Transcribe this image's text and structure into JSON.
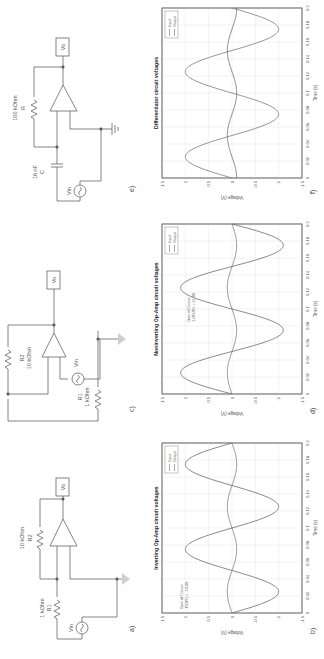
{
  "figure": {
    "panels": [
      {
        "id": "a",
        "label": "a)",
        "type": "circuit",
        "name": "Inverting amplifier",
        "components": {
          "R1": {
            "name": "R1",
            "value": "1 kOhm"
          },
          "R2": {
            "name": "R2",
            "value": "10 kOhm"
          },
          "source": "Vin",
          "probe": "Vo"
        }
      },
      {
        "id": "b",
        "label": "b)",
        "type": "chart",
        "title": "Inverting Op-Amp circuit voltages",
        "annotation_line1": "Gain of Circuit:",
        "annotation_line2": "-R2/R1 = -10.00"
      },
      {
        "id": "c",
        "label": "c)",
        "type": "circuit",
        "name": "Noninverting amplifier",
        "components": {
          "R1": {
            "name": "R1",
            "value": "1 kOhm"
          },
          "R2": {
            "name": "R2",
            "value": "10 kOhm"
          },
          "source": "Vin",
          "probe": "Vo"
        }
      },
      {
        "id": "d",
        "label": "d)",
        "type": "chart",
        "title": "Noninverting Op-Amp circuit voltages",
        "annotation_line1": "Gain of Circuit:",
        "annotation_line2": "1+R2/R1 = 11.00"
      },
      {
        "id": "e",
        "label": "e)",
        "type": "circuit",
        "name": "Differentiator",
        "components": {
          "C": {
            "name": "C",
            "value": "16 nF"
          },
          "R": {
            "name": "R",
            "value": "100 kOhm"
          },
          "source": "Vin",
          "probe": "Vo"
        }
      },
      {
        "id": "f",
        "label": "f)",
        "type": "chart",
        "title": "Differentiator circuit voltages",
        "annotation_line1": "",
        "annotation_line2": ""
      }
    ],
    "axes": {
      "xlabel": "Time (s)",
      "ylabel": "Voltage (V)",
      "xticks": [
        "0",
        "0.02",
        "0.04",
        "0.06",
        "0.08",
        "0.1",
        "0.12",
        "0.14",
        "0.16",
        "0.18",
        "0.2"
      ],
      "yticks": [
        "1.5",
        "1",
        "0.5",
        "0",
        "-0.5",
        "-1",
        "-1.5"
      ]
    },
    "legend": {
      "input": "Input",
      "output": "Output"
    },
    "colors": {
      "input": "#7a7a7a",
      "output": "#6a6a6a",
      "grid": "#e6e6e6",
      "axis": "#555555"
    }
  },
  "chart_data": [
    {
      "type": "line",
      "title": "Inverting Op-Amp circuit voltages",
      "xlabel": "Time (s)",
      "ylabel": "Voltage (V)",
      "xlim": [
        0,
        0.2
      ],
      "ylim": [
        -1.5,
        1.5
      ],
      "grid": true,
      "legend_position": "top-right",
      "x": [
        0,
        0.025,
        0.05,
        0.075,
        0.1,
        0.125,
        0.15,
        0.175,
        0.2
      ],
      "series": [
        {
          "name": "Input",
          "values": [
            0,
            0.1,
            0,
            -0.1,
            0,
            0.1,
            0,
            -0.1,
            0
          ]
        },
        {
          "name": "Output",
          "values": [
            0,
            -1.0,
            0,
            1.0,
            0,
            -1.0,
            0,
            1.0,
            0
          ]
        }
      ],
      "annotations": [
        "Gain of Circuit:",
        "-R2/R1 = -10.00"
      ]
    },
    {
      "type": "line",
      "title": "Noninverting Op-Amp circuit voltages",
      "xlabel": "Time (s)",
      "ylabel": "Voltage (V)",
      "xlim": [
        0,
        0.2
      ],
      "ylim": [
        -1.5,
        1.5
      ],
      "grid": true,
      "legend_position": "top-right",
      "x": [
        0,
        0.025,
        0.05,
        0.075,
        0.1,
        0.125,
        0.15,
        0.175,
        0.2
      ],
      "series": [
        {
          "name": "Input",
          "values": [
            0,
            0.1,
            0,
            -0.1,
            0,
            0.1,
            0,
            -0.1,
            0
          ]
        },
        {
          "name": "Output",
          "values": [
            0,
            1.1,
            0,
            -1.1,
            0,
            1.1,
            0,
            -1.1,
            0
          ]
        }
      ],
      "annotations": [
        "Gain of Circuit:",
        "1+R2/R1 = 11.00"
      ]
    },
    {
      "type": "line",
      "title": "Differentiator circuit voltages",
      "xlabel": "Time (s)",
      "ylabel": "Voltage (V)",
      "xlim": [
        0,
        0.2
      ],
      "ylim": [
        -1.5,
        1.5
      ],
      "grid": true,
      "legend_position": "top-right",
      "x": [
        0,
        0.025,
        0.05,
        0.075,
        0.1,
        0.125,
        0.15,
        0.175,
        0.2
      ],
      "series": [
        {
          "name": "Input",
          "values": [
            0,
            1.0,
            0,
            -1.0,
            0,
            1.0,
            0,
            -1.0,
            0
          ]
        },
        {
          "name": "Output",
          "values": [
            -0.1,
            0,
            0.1,
            0,
            -0.1,
            0,
            0.1,
            0,
            -0.1
          ]
        }
      ]
    }
  ]
}
